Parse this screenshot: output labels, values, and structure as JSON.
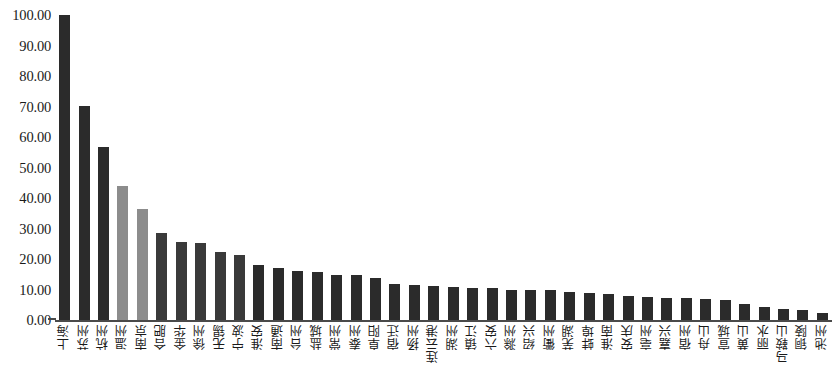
{
  "chart_data": {
    "type": "bar",
    "title": "",
    "subtitle": "",
    "xlabel": "",
    "ylabel": "",
    "ylim": [
      0,
      100
    ],
    "ytick_step": 10,
    "ytick_labels": [
      "0.00",
      "10.00",
      "20.00",
      "30.00",
      "40.00",
      "50.00",
      "60.00",
      "70.00",
      "80.00",
      "90.00",
      "100.00"
    ],
    "grid": false,
    "legend": null,
    "bar_color_default": "#2b2b2b",
    "bar_color_highlight": "#8c8c8c",
    "axis_color": "#4a4a4a",
    "background_color": "#ffffff",
    "categories": [
      "上海",
      "苏州",
      "杭州",
      "温州",
      "南京",
      "合肥",
      "金华",
      "徐州",
      "无锡",
      "宁波",
      "淮安",
      "南通",
      "台州",
      "盐城",
      "常州",
      "泰州",
      "阜阳",
      "宿迁",
      "扬州",
      "连云港",
      "湖州",
      "镇江",
      "六安",
      "滁州",
      "绍兴",
      "衢州",
      "芜湖",
      "蚌埠",
      "淮南",
      "安庆",
      "亳州",
      "嘉兴",
      "宿州",
      "舟山",
      "宣城",
      "黄山",
      "丽水",
      "马鞍山",
      "铜陵",
      "池州"
    ],
    "values": [
      100.0,
      70.2,
      56.7,
      44.1,
      36.3,
      28.5,
      25.6,
      25.2,
      22.4,
      21.4,
      18.1,
      17.1,
      16.0,
      15.6,
      14.9,
      14.7,
      13.7,
      11.8,
      11.5,
      11.0,
      10.9,
      10.6,
      10.5,
      9.9,
      9.8,
      9.7,
      9.3,
      8.8,
      8.5,
      8.0,
      7.6,
      7.3,
      7.1,
      6.8,
      6.4,
      5.1,
      4.3,
      3.7,
      3.2,
      2.3
    ],
    "bar_colors": [
      "#2b2b2b",
      "#2b2b2b",
      "#2b2b2b",
      "#8c8c8c",
      "#8c8c8c",
      "#3a3a3a",
      "#3a3a3a",
      "#3a3a3a",
      "#3a3a3a",
      "#3a3a3a",
      "#2b2b2b",
      "#2b2b2b",
      "#2b2b2b",
      "#2b2b2b",
      "#2b2b2b",
      "#2b2b2b",
      "#2b2b2b",
      "#2b2b2b",
      "#2b2b2b",
      "#2b2b2b",
      "#2b2b2b",
      "#2b2b2b",
      "#2b2b2b",
      "#2b2b2b",
      "#2b2b2b",
      "#2b2b2b",
      "#2b2b2b",
      "#2b2b2b",
      "#2b2b2b",
      "#2b2b2b",
      "#2b2b2b",
      "#2b2b2b",
      "#2b2b2b",
      "#2b2b2b",
      "#2b2b2b",
      "#2b2b2b",
      "#2b2b2b",
      "#2b2b2b",
      "#2b2b2b",
      "#2b2b2b"
    ]
  }
}
